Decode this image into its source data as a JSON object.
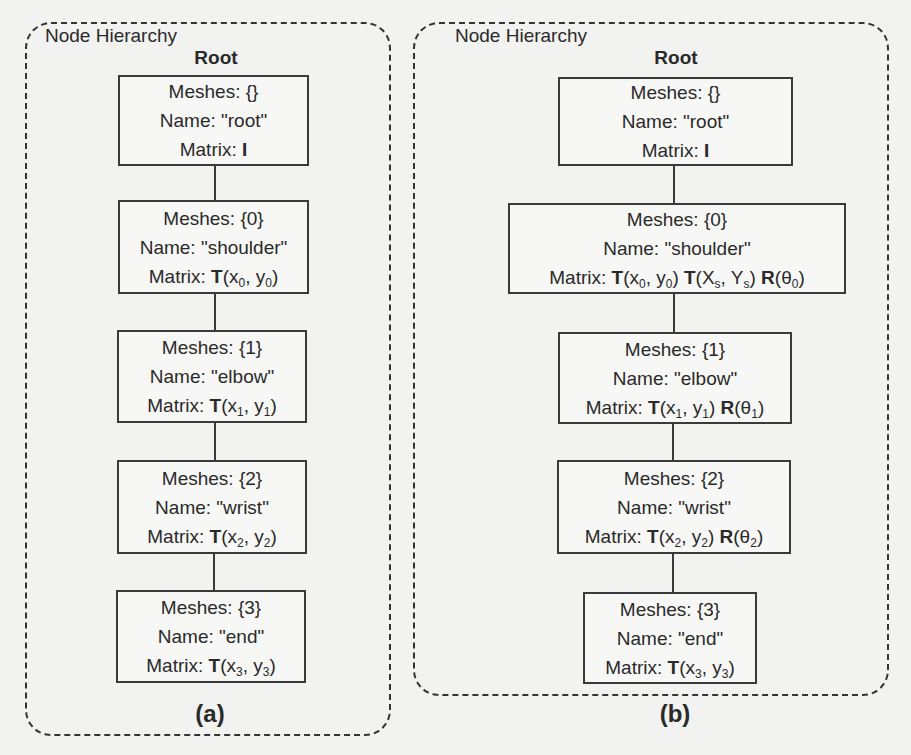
{
  "panels": [
    {
      "id": "a",
      "title": "Node Hierarchy",
      "root_label": "Root",
      "caption": "(a)",
      "nodes": [
        {
          "meshes": "Meshes:  {}",
          "name": "Name: \"root\"",
          "matrix_prefix": "Matrix: ",
          "matrix_terms": [
            {
              "op": "I",
              "args": ""
            }
          ]
        },
        {
          "meshes": "Meshes:  {0}",
          "name": "Name: \"shoulder\"",
          "matrix_prefix": "Matrix: ",
          "matrix_terms": [
            {
              "op": "T",
              "args": "(x0, y0)"
            }
          ]
        },
        {
          "meshes": "Meshes:  {1}",
          "name": "Name: \"elbow\"",
          "matrix_prefix": "Matrix: ",
          "matrix_terms": [
            {
              "op": "T",
              "args": "(x1, y1)"
            }
          ]
        },
        {
          "meshes": "Meshes:  {2}",
          "name": "Name: \"wrist\"",
          "matrix_prefix": "Matrix: ",
          "matrix_terms": [
            {
              "op": "T",
              "args": "(x2, y2)"
            }
          ]
        },
        {
          "meshes": "Meshes:  {3}",
          "name": "Name: \"end\"",
          "matrix_prefix": "Matrix: ",
          "matrix_terms": [
            {
              "op": "T",
              "args": "(x3, y3)"
            }
          ]
        }
      ]
    },
    {
      "id": "b",
      "title": "Node Hierarchy",
      "root_label": "Root",
      "caption": "(b)",
      "nodes": [
        {
          "meshes": "Meshes:  {}",
          "name": "Name: \"root\"",
          "matrix_prefix": "Matrix: ",
          "matrix_terms": [
            {
              "op": "I",
              "args": ""
            }
          ]
        },
        {
          "meshes": "Meshes:  {0}",
          "name": "Name: \"shoulder\"",
          "matrix_prefix": "Matrix: ",
          "matrix_terms": [
            {
              "op": "T",
              "args": "(x0, y0)"
            },
            {
              "op": "T",
              "args": "(Xs, Ys)"
            },
            {
              "op": "R",
              "args": "(θ0)"
            }
          ]
        },
        {
          "meshes": "Meshes:  {1}",
          "name": "Name: \"elbow\"",
          "matrix_prefix": "Matrix: ",
          "matrix_terms": [
            {
              "op": "T",
              "args": "(x1, y1)"
            },
            {
              "op": "R",
              "args": "(θ1)"
            }
          ]
        },
        {
          "meshes": "Meshes:  {2}",
          "name": "Name: \"wrist\"",
          "matrix_prefix": "Matrix: ",
          "matrix_terms": [
            {
              "op": "T",
              "args": "(x2, y2)"
            },
            {
              "op": "R",
              "args": "(θ2)"
            }
          ]
        },
        {
          "meshes": "Meshes:  {3}",
          "name": "Name: \"end\"",
          "matrix_prefix": "Matrix: ",
          "matrix_terms": [
            {
              "op": "T",
              "args": "(x3, y3)"
            }
          ]
        }
      ]
    }
  ]
}
